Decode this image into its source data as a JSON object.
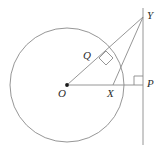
{
  "figure": {
    "type": "geometry-diagram",
    "width": 168,
    "height": 152,
    "stroke_color": "#8a8a8a",
    "label_color": "#2b2b2b",
    "background": "#ffffff"
  },
  "circle": {
    "name": "main-circle",
    "center_label": "O",
    "cx": 67,
    "cy": 85,
    "r": 57
  },
  "points": [
    {
      "id": "O",
      "label": "O",
      "x": 67,
      "y": 85,
      "label_x": 58,
      "label_y": 88,
      "dot": true
    },
    {
      "id": "Q",
      "label": "Q",
      "x": 105,
      "y": 61,
      "label_x": 83,
      "label_y": 50,
      "dot": false
    },
    {
      "id": "X",
      "label": "X",
      "x": 113,
      "y": 85,
      "label_x": 107,
      "label_y": 88,
      "dot": false
    },
    {
      "id": "P",
      "label": "P",
      "x": 143,
      "y": 85,
      "label_x": 147,
      "label_y": 78,
      "dot": false
    },
    {
      "id": "Y",
      "label": "Y",
      "x": 143,
      "y": 17,
      "label_x": 147,
      "label_y": 10,
      "dot": false
    }
  ],
  "segments": [
    {
      "name": "segment-O-Y",
      "x1": 67,
      "y1": 85,
      "x2": 143,
      "y2": 17
    },
    {
      "name": "segment-O-P",
      "x1": 67,
      "y1": 85,
      "x2": 143,
      "y2": 85
    },
    {
      "name": "segment-X-Y",
      "x1": 113,
      "y1": 85,
      "x2": 143,
      "y2": 17
    },
    {
      "name": "line-Y-P-vertical",
      "x1": 143,
      "y1": 8,
      "x2": 143,
      "y2": 145
    }
  ],
  "right_angle_marks": [
    {
      "name": "right-angle-at-Q",
      "vertex": "Q",
      "points": "99,58 106,51 113,58 106,65"
    },
    {
      "name": "right-angle-at-P",
      "vertex": "P",
      "points": "134,85 134,76 143,76"
    }
  ]
}
